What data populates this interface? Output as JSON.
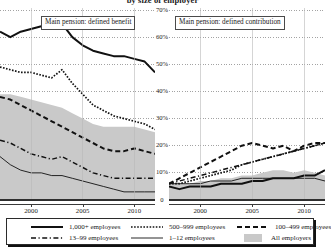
{
  "title": "by size of employer",
  "panels": [
    {
      "caption": "Main pension: defined benefit"
    },
    {
      "caption": "Main pension: defined contribution"
    }
  ],
  "yaxis": {
    "ticks": [
      "0",
      "10%",
      "20%",
      "30%",
      "40%",
      "50%",
      "60%",
      "70%"
    ],
    "min": 0,
    "max": 70
  },
  "xaxis": {
    "ticks": [
      "2000",
      "2005",
      "2010"
    ],
    "min": 1997,
    "max": 2012
  },
  "legend": {
    "items": [
      {
        "label": "1,000+ employees",
        "style": "solid-thick",
        "icon": "line-solid-thick-icon"
      },
      {
        "label": "500–999 employees",
        "style": "dotted",
        "icon": "line-dotted-icon"
      },
      {
        "label": "100–499 employees",
        "style": "dashed",
        "icon": "line-dashed-icon"
      },
      {
        "label": "13–99 employees",
        "style": "dashdot",
        "icon": "line-dashdot-icon"
      },
      {
        "label": "1–12 employees",
        "style": "solid-thin",
        "icon": "line-solid-thin-icon"
      },
      {
        "label": "All employers",
        "style": "area",
        "icon": "area-swatch-icon"
      }
    ]
  },
  "chart_data": {
    "type": "line",
    "title": "by size of employer",
    "xlabel": "",
    "ylabel": "",
    "xlim": [
      1997,
      2012
    ],
    "ylim": [
      0,
      70
    ],
    "grid": "horizontal-dotted",
    "legend_position": "bottom",
    "panels": [
      {
        "name": "Main pension: defined benefit",
        "x": [
          1997,
          1998,
          1999,
          2000,
          2001,
          2002,
          2003,
          2004,
          2005,
          2006,
          2007,
          2008,
          2009,
          2010,
          2011,
          2012
        ],
        "series": [
          {
            "name": "All employers",
            "type": "area",
            "values": [
              39,
              39,
              38,
              37,
              36,
              35,
              34,
              32,
              30,
              28,
              27,
              27,
              27,
              27,
              26,
              25
            ]
          },
          {
            "name": "1,000+ employees",
            "values": [
              62,
              60,
              62,
              63,
              64,
              63,
              65,
              60,
              57,
              55,
              54,
              53,
              53,
              52,
              51,
              47
            ]
          },
          {
            "name": "500–999 employees",
            "values": [
              49,
              48,
              47,
              47,
              46,
              45,
              48,
              43,
              39,
              35,
              33,
              31,
              30,
              29,
              28,
              26
            ]
          },
          {
            "name": "100–499 employees",
            "values": [
              38,
              37,
              35,
              33,
              31,
              29,
              27,
              25,
              23,
              21,
              19,
              18,
              18,
              19,
              18,
              17
            ]
          },
          {
            "name": "13–99 employees",
            "values": [
              22,
              21,
              19,
              17,
              16,
              15,
              16,
              14,
              12,
              10,
              9,
              8,
              8,
              8,
              8,
              8
            ]
          },
          {
            "name": "1–12 employees",
            "values": [
              16,
              13,
              11,
              10,
              10,
              9,
              9,
              8,
              7,
              6,
              5,
              4,
              3,
              3,
              3,
              3
            ]
          }
        ]
      },
      {
        "name": "Main pension: defined contribution",
        "x": [
          1997,
          1998,
          1999,
          2000,
          2001,
          2002,
          2003,
          2004,
          2005,
          2006,
          2007,
          2008,
          2009,
          2010,
          2011,
          2012
        ],
        "series": [
          {
            "name": "All employers",
            "type": "area",
            "values": [
              6,
              6,
              6,
              7,
              7,
              8,
              8,
              9,
              9,
              10,
              11,
              11,
              10,
              11,
              10,
              9
            ]
          },
          {
            "name": "1,000+ employees",
            "values": [
              5,
              4,
              5,
              5,
              5,
              6,
              6,
              6,
              7,
              7,
              8,
              8,
              8,
              9,
              9,
              11
            ]
          },
          {
            "name": "500–999 employees",
            "values": [
              6,
              6,
              7,
              8,
              9,
              10,
              11,
              13,
              14,
              15,
              16,
              17,
              18,
              19,
              20,
              21
            ]
          },
          {
            "name": "100–499 employees",
            "values": [
              6,
              8,
              10,
              12,
              14,
              16,
              18,
              20,
              21,
              20,
              19,
              20,
              18,
              20,
              21,
              21
            ]
          },
          {
            "name": "13–99 employees",
            "values": [
              6,
              7,
              8,
              9,
              10,
              11,
              12,
              13,
              14,
              15,
              16,
              17,
              18,
              19,
              20,
              21
            ]
          },
          {
            "name": "1–12 employees",
            "values": [
              6,
              6,
              6,
              6,
              7,
              7,
              7,
              8,
              8,
              8,
              8,
              8,
              8,
              8,
              8,
              7
            ]
          }
        ]
      }
    ]
  }
}
